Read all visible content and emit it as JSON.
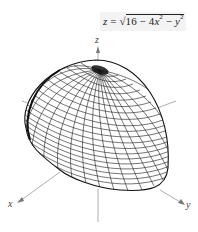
{
  "figure": {
    "equation": {
      "lhs": "z",
      "eq": "=",
      "radical": "√",
      "radicand_a": "16 − 4x",
      "exp1": "2",
      "radicand_b": " − y",
      "exp2": "2",
      "full_text": "z = √(16 − 4x² − y²)"
    },
    "axes": {
      "x_label": "x",
      "y_label": "y",
      "z_label": "z"
    },
    "surface": {
      "type": "upper half-ellipsoid wireframe",
      "description": "Upper hemisphere of ellipsoid 4x² + y² + z² = 16, z ≥ 0",
      "line_color": "#1a1a1a"
    },
    "colors": {
      "axis": "#8a8a8a",
      "mesh": "#1a1a1a",
      "label_bg": "#f3f3f3"
    }
  }
}
